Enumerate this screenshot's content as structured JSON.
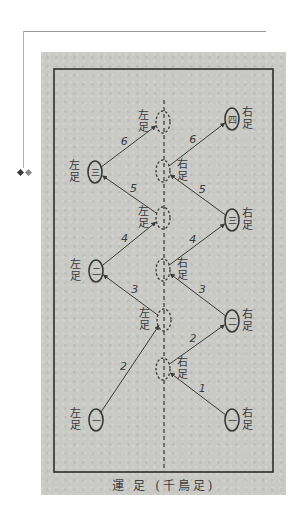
{
  "diagram": {
    "title": "運 足 (千鳥足)",
    "centerline": {
      "x": 164,
      "y1": 100,
      "y2": 470
    },
    "footprints": [
      {
        "id": "L1",
        "side": "left",
        "label": "左足",
        "glyph": "一",
        "x": 96,
        "y": 420,
        "solid": true
      },
      {
        "id": "R1",
        "side": "right",
        "label": "右足",
        "glyph": "一",
        "x": 232,
        "y": 420,
        "solid": true
      },
      {
        "id": "R2",
        "side": "right",
        "label": "右足",
        "glyph": "二",
        "x": 232,
        "y": 321,
        "solid": true
      },
      {
        "id": "L2",
        "side": "left",
        "label": "左足",
        "glyph": "二",
        "x": 96,
        "y": 271,
        "solid": true
      },
      {
        "id": "R3",
        "side": "right",
        "label": "右足",
        "glyph": "三",
        "x": 232,
        "y": 220,
        "solid": true
      },
      {
        "id": "L3",
        "side": "left",
        "label": "左足",
        "glyph": "三",
        "x": 95,
        "y": 172,
        "solid": true
      },
      {
        "id": "R4",
        "side": "right",
        "label": "右足",
        "glyph": "四",
        "x": 232,
        "y": 119,
        "solid": true
      },
      {
        "id": "C1",
        "side": "right",
        "label": "右足",
        "glyph": "",
        "x": 163,
        "y": 369,
        "solid": false
      },
      {
        "id": "C2",
        "side": "left",
        "label": "左足",
        "glyph": "",
        "x": 164,
        "y": 320,
        "solid": false
      },
      {
        "id": "C3",
        "side": "right",
        "label": "右足",
        "glyph": "",
        "x": 163,
        "y": 270,
        "solid": false
      },
      {
        "id": "C4",
        "side": "left",
        "label": "左足",
        "glyph": "",
        "x": 163,
        "y": 218,
        "solid": false
      },
      {
        "id": "C5",
        "side": "right",
        "label": "右足",
        "glyph": "",
        "x": 163,
        "y": 171,
        "solid": false
      },
      {
        "id": "C6",
        "side": "left",
        "label": "左足",
        "glyph": "",
        "x": 163,
        "y": 122,
        "solid": false
      }
    ],
    "moves": [
      {
        "step": "1",
        "from": "R1",
        "to": "C1"
      },
      {
        "step": "2",
        "from": "L1",
        "to": "C2"
      },
      {
        "step": "2",
        "from": "C1",
        "to": "R2"
      },
      {
        "step": "3",
        "from": "C2",
        "to": "L2"
      },
      {
        "step": "3",
        "from": "R2",
        "to": "C3"
      },
      {
        "step": "4",
        "from": "L2",
        "to": "C4"
      },
      {
        "step": "4",
        "from": "C3",
        "to": "R3"
      },
      {
        "step": "5",
        "from": "C4",
        "to": "L3"
      },
      {
        "step": "5",
        "from": "R3",
        "to": "C5"
      },
      {
        "step": "6",
        "from": "L3",
        "to": "C6"
      },
      {
        "step": "6",
        "from": "C5",
        "to": "R4"
      }
    ],
    "colors": {
      "ink": "#3a3a3a",
      "paper": "#c9c9c6"
    }
  }
}
